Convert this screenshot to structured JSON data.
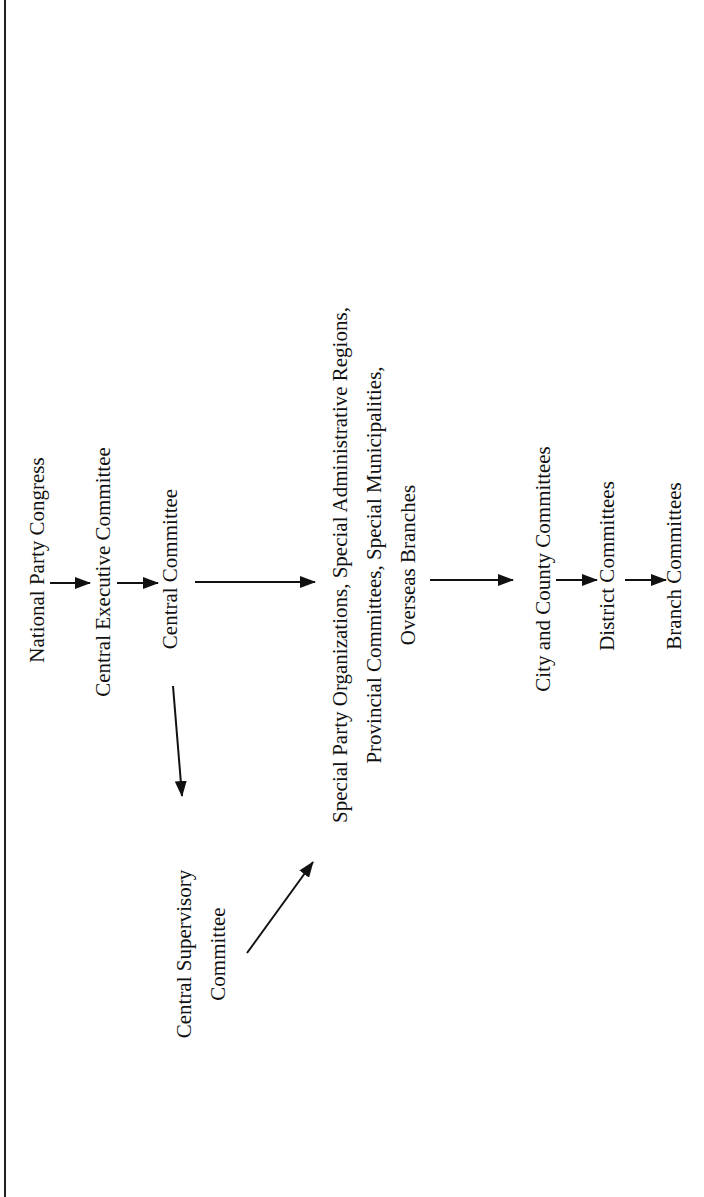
{
  "diagram": {
    "type": "organization-hierarchy",
    "orientation": "rotated-90-ccw",
    "nodes": [
      {
        "id": "npc",
        "lines": [
          "National Party Congress"
        ]
      },
      {
        "id": "cec",
        "lines": [
          "Central Executive Committee"
        ]
      },
      {
        "id": "cc",
        "lines": [
          "Central Committee"
        ]
      },
      {
        "id": "csc",
        "lines": [
          "Central Supervisory",
          "Committee"
        ]
      },
      {
        "id": "spo",
        "lines": [
          "Special Party Organizations, Special Administrative Regions,",
          "Provincial Committees, Special Municipalities,",
          "Overseas Branches"
        ]
      },
      {
        "id": "ccc",
        "lines": [
          "City and County Committees"
        ]
      },
      {
        "id": "dc",
        "lines": [
          "District Committees"
        ]
      },
      {
        "id": "bc",
        "lines": [
          "Branch Committees"
        ]
      }
    ],
    "edges": [
      {
        "from": "npc",
        "to": "cec"
      },
      {
        "from": "cec",
        "to": "cc"
      },
      {
        "from": "cc",
        "to": "spo"
      },
      {
        "from": "cc",
        "to": "csc"
      },
      {
        "from": "csc",
        "to": "spo"
      },
      {
        "from": "spo",
        "to": "ccc"
      },
      {
        "from": "ccc",
        "to": "dc"
      },
      {
        "from": "dc",
        "to": "bc"
      }
    ]
  },
  "colors": {
    "background": "#ffffff",
    "ink": "#111111",
    "border": "#222222"
  }
}
